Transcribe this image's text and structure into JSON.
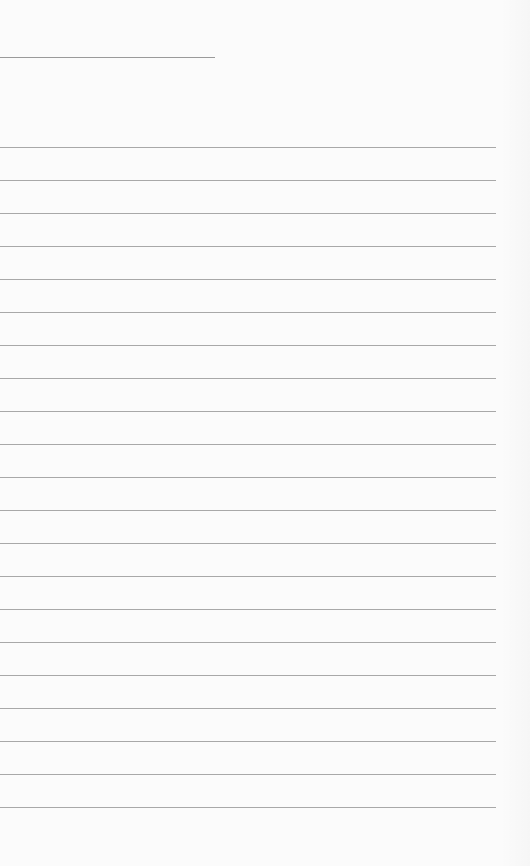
{
  "page": {
    "type": "blank lined sheet",
    "header_line": {
      "top": 57,
      "width": 215
    },
    "rules": {
      "count": 21,
      "first_top": 147,
      "spacing": 33,
      "width": 496,
      "color": "#a8a8a8"
    },
    "background": "#fbfbfb"
  }
}
